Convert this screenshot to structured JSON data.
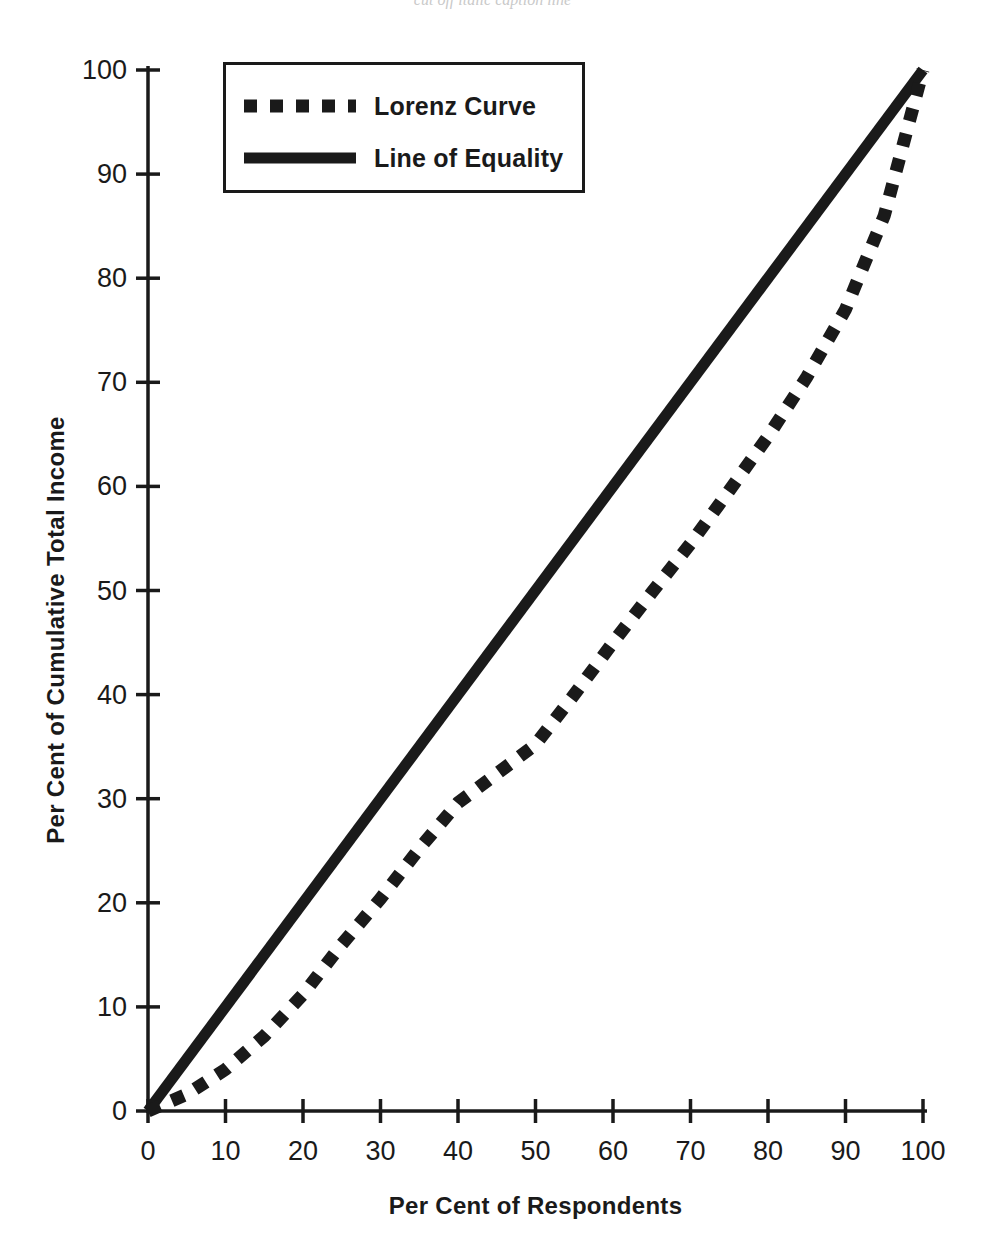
{
  "caption": {
    "text": "cut off italic caption line"
  },
  "chart_data": {
    "type": "line",
    "title": "",
    "xlabel": "Per Cent of Respondents",
    "ylabel": "Per Cent of Cumulative Total Income",
    "xlim": [
      0,
      100
    ],
    "ylim": [
      0,
      100
    ],
    "xticks": [
      0,
      10,
      20,
      30,
      40,
      50,
      60,
      70,
      80,
      90,
      100
    ],
    "yticks": [
      0,
      10,
      20,
      30,
      40,
      50,
      60,
      70,
      80,
      90,
      100
    ],
    "xtick_labels": [
      "0",
      "10",
      "20",
      "30",
      "40",
      "50",
      "60",
      "70",
      "80",
      "90",
      "100"
    ],
    "ytick_labels": [
      "0",
      "10",
      "20",
      "30",
      "40",
      "50",
      "60",
      "70",
      "80",
      "90",
      "100"
    ],
    "grid": false,
    "legend_position": "upper-left-inside",
    "series": [
      {
        "name": "Lorenz Curve",
        "style": "dotted",
        "color": "#1a1a1a",
        "x": [
          0,
          5,
          10,
          15,
          20,
          25,
          30,
          35,
          40,
          45,
          50,
          55,
          60,
          65,
          70,
          75,
          80,
          85,
          90,
          95,
          100
        ],
        "values": [
          0,
          1.6,
          4.0,
          7.2,
          11.2,
          16.0,
          20.4,
          25.2,
          29.6,
          32.4,
          35.2,
          40.0,
          45.0,
          49.8,
          54.5,
          59.6,
          64.8,
          70.5,
          77.0,
          86.0,
          100.0
        ]
      },
      {
        "name": "Line of Equality",
        "style": "solid",
        "color": "#1a1a1a",
        "x": [
          0,
          100
        ],
        "values": [
          0,
          100
        ]
      }
    ]
  },
  "legend": {
    "entries": [
      {
        "label": "Lorenz Curve",
        "style": "dotted"
      },
      {
        "label": "Line of Equality",
        "style": "solid"
      }
    ]
  },
  "axes": {
    "x_title": "Per Cent of Respondents",
    "y_title": "Per Cent of Cumulative Total Income"
  }
}
